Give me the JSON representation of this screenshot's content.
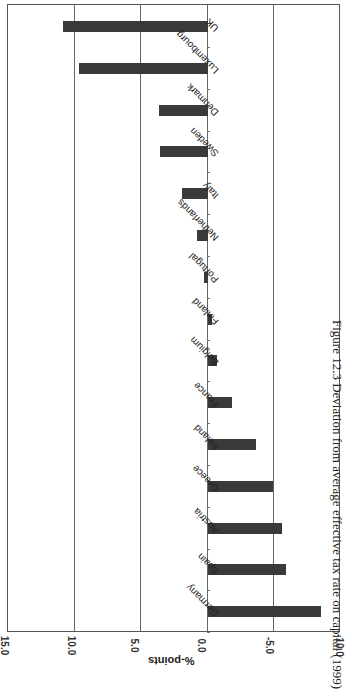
{
  "chart_data": {
    "type": "bar",
    "orientation": "rotated-90 (horizontal bars as printed)",
    "title": "Figure 12.3 Deviation from average effective tax rate on capital (1999)",
    "xlabel": "",
    "ylabel": "%-points",
    "ylim": [
      -10.0,
      15.0
    ],
    "ticks": [
      "15.0",
      "10.0",
      "5.0",
      "0.0",
      "-5.0",
      "-10.0"
    ],
    "grid": true,
    "categories": [
      "UK",
      "Luxembourg",
      "Denmark",
      "Sweden",
      "Italy",
      "Netherlands",
      "Portugal",
      "Finland",
      "Belgium",
      "France",
      "Ireland",
      "Greece",
      "Austria",
      "Spain",
      "Germany"
    ],
    "values": [
      10.9,
      9.7,
      3.7,
      3.6,
      1.9,
      0.8,
      0.3,
      -0.3,
      -0.7,
      -1.8,
      -3.6,
      -4.9,
      -5.6,
      -5.9,
      -8.5
    ],
    "bar_color": "#3a3a3a"
  },
  "caption": "Figure 12.3 Deviation from average effective tax rate on capital (1999)",
  "axis": {
    "title": "%-points",
    "ticks": [
      "15.0",
      "10.0",
      "5.0",
      "0.0",
      "-5.0",
      "-10.0"
    ]
  }
}
